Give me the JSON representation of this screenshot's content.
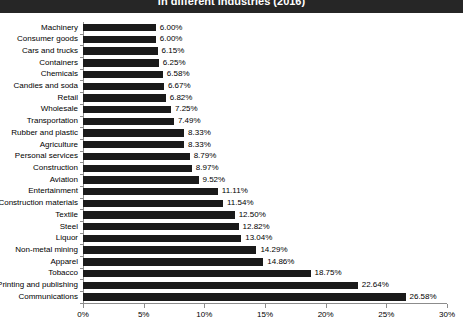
{
  "chart": {
    "title": "in different industries (2016)",
    "title_bg": "#262626",
    "title_color": "#ffffff",
    "bar_color": "#1a1a1a",
    "axis_color": "#8c8c8c",
    "background": "#ffffff"
  },
  "chart_data": {
    "type": "bar",
    "orientation": "horizontal",
    "title": "in different industries (2016)",
    "xlabel": "",
    "ylabel": "",
    "xlim": [
      0,
      30
    ],
    "xticks": [
      "0%",
      "5%",
      "10%",
      "15%",
      "20%",
      "25%",
      "30%"
    ],
    "xtick_values": [
      0,
      5,
      10,
      15,
      20,
      25,
      30
    ],
    "grid": false,
    "legend": false,
    "unit": "%",
    "categories": [
      "Machinery",
      "Consumer goods",
      "Cars and trucks",
      "Containers",
      "Chemicals",
      "Candies and soda",
      "Retail",
      "Wholesale",
      "Transportation",
      "Rubber and plastic",
      "Agriculture",
      "Personal services",
      "Construction",
      "Aviation",
      "Entertainment",
      "Construction materials",
      "Textile",
      "Steel",
      "Liquor",
      "Non-metal mining",
      "Apparel",
      "Tobacco",
      "Printing and publishing",
      "Communications"
    ],
    "values": [
      6.0,
      6.0,
      6.15,
      6.25,
      6.58,
      6.67,
      6.82,
      7.25,
      7.49,
      8.33,
      8.33,
      8.79,
      8.97,
      9.52,
      11.11,
      11.54,
      12.5,
      12.82,
      13.04,
      14.29,
      14.86,
      18.75,
      22.64,
      26.58
    ],
    "data_labels": [
      "6.00%",
      "6.00%",
      "6.15%",
      "6.25%",
      "6.58%",
      "6.67%",
      "6.82%",
      "7.25%",
      "7.49%",
      "8.33%",
      "8.33%",
      "8.79%",
      "8.97%",
      "9.52%",
      "11.11%",
      "11.54%",
      "12.50%",
      "12.82%",
      "13.04%",
      "14.29%",
      "14.86%",
      "18.75%",
      "22.64%",
      "26.58%"
    ]
  }
}
